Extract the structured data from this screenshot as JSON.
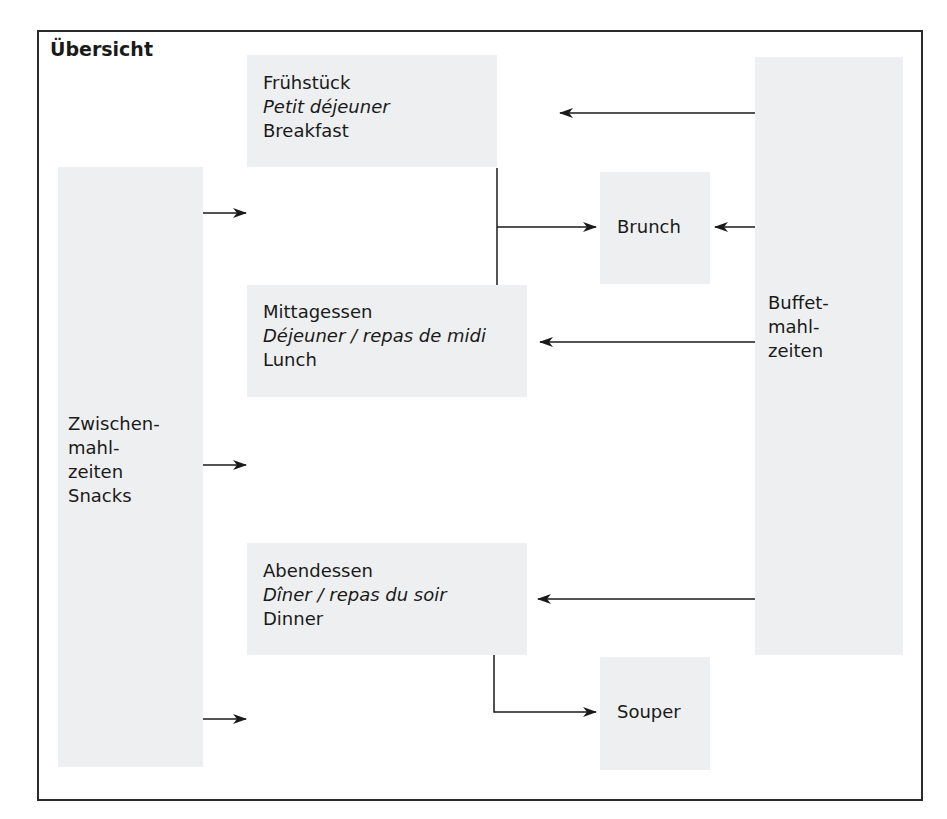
{
  "title": "Übersicht",
  "colors": {
    "box_fill": "#eeeff0",
    "line": "#1a1a1a",
    "frame": "#2a2a2a"
  },
  "meals": {
    "breakfast": {
      "de": "Frühstück",
      "fr": "Petit déjeuner",
      "en": "Breakfast"
    },
    "lunch": {
      "de": "Mittagessen",
      "fr": "Déjeuner / repas de midi",
      "en": "Lunch"
    },
    "dinner": {
      "de": "Abendessen",
      "fr": "Dîner / repas du soir",
      "en": "Dinner"
    }
  },
  "brunch": {
    "label": "Brunch"
  },
  "souper": {
    "label": "Souper"
  },
  "snacks": {
    "line1": "Zwischen-",
    "line2": "mahl-",
    "line3": "zeiten",
    "line4": "Snacks"
  },
  "buffet": {
    "line1": "Buffet-",
    "line2": "mahl-",
    "line3": "zeiten"
  },
  "connections": [
    {
      "from": "buffet",
      "to": "breakfast"
    },
    {
      "from": "buffet",
      "to": "brunch"
    },
    {
      "from": "buffet",
      "to": "lunch"
    },
    {
      "from": "buffet",
      "to": "dinner"
    },
    {
      "from": "breakfast+lunch",
      "to": "brunch"
    },
    {
      "from": "dinner",
      "to": "souper"
    },
    {
      "from": "snacks",
      "to": "between-breakfast-lunch"
    },
    {
      "from": "snacks",
      "to": "between-lunch-dinner"
    },
    {
      "from": "snacks",
      "to": "after-dinner"
    }
  ]
}
